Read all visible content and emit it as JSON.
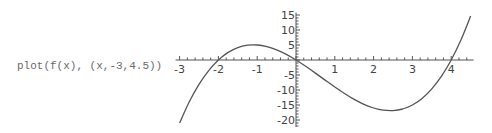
{
  "command": {
    "text": "plot(f(x), (x,-3,4.5))"
  },
  "chart_data": {
    "type": "line",
    "title": "",
    "xlabel": "",
    "ylabel": "",
    "function": "f(x)",
    "xlim": [
      -3,
      4.5
    ],
    "ylim": [
      -21,
      15
    ],
    "grid": false,
    "legend": null,
    "x_ticks": [
      -3,
      -2,
      -1,
      1,
      2,
      3,
      4
    ],
    "y_ticks": [
      15,
      10,
      5,
      -5,
      -10,
      -15,
      -20
    ],
    "series": [
      {
        "name": "f(x)",
        "color": "#555555",
        "x": [
          -3,
          -2.75,
          -2.5,
          -2.25,
          -2,
          -1.75,
          -1.5,
          -1.25,
          -1,
          -0.75,
          -0.5,
          -0.25,
          0,
          0.25,
          0.5,
          0.75,
          1,
          1.25,
          1.5,
          1.75,
          2,
          2.25,
          2.5,
          2.75,
          3,
          3.25,
          3.5,
          3.75,
          4,
          4.25,
          4.5
        ],
        "y": [
          -21,
          -13.92,
          -8.13,
          -3.52,
          0,
          2.52,
          4.13,
          4.92,
          5,
          4.45,
          3.38,
          1.86,
          0,
          -2.11,
          -4.38,
          -6.7,
          -9,
          -11.17,
          -13.13,
          -14.77,
          -16,
          -16.73,
          -16.88,
          -16.33,
          -15,
          -12.8,
          -9.63,
          -5.39,
          0,
          6.64,
          14.63
        ]
      }
    ]
  }
}
